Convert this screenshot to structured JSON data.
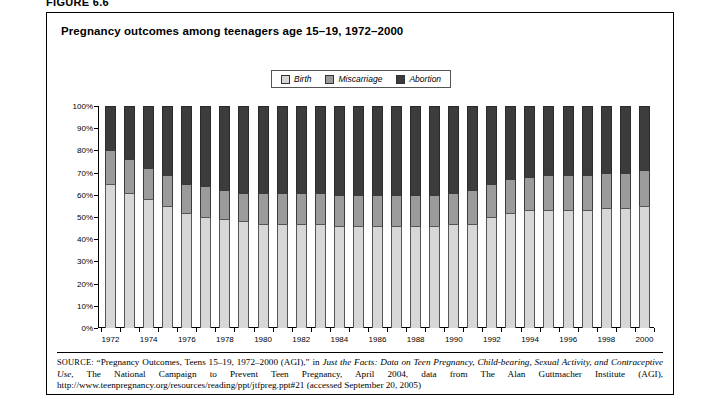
{
  "figure": {
    "label": "FIGURE 6.6"
  },
  "chart": {
    "title": "Pregnancy outcomes among teenagers age 15–19, 1972–2000"
  },
  "legend": {
    "position": "top-center",
    "items": [
      {
        "label": "Birth",
        "color": "#d7d7d7",
        "icon": "legend-swatch-birth"
      },
      {
        "label": "Miscarriage",
        "color": "#9b9b9b",
        "icon": "legend-swatch-miscarriage"
      },
      {
        "label": "Abortion",
        "color": "#3c3c3c",
        "icon": "legend-swatch-abortion"
      }
    ]
  },
  "source": {
    "prefix": "SOURCE:",
    "part1": " “Pregnancy Outcomes, Teens 15–19, 1972–2000 (AGI),” in ",
    "italic1": "Just the Facts: Data on Teen Pregnancy, Child-bearing, Sexual Activity, and Contraceptive Use",
    "part2": ", The National Campaign to Prevent Teen Pregnancy, April 2004, data from The Alan Guttmacher Institute (AGI), http://www.teenpregnancy.org/resources/reading/ppt/jtfpreg.ppt#21 (accessed September 20, 2005)"
  },
  "chart_data": {
    "type": "bar",
    "subtype": "stacked-100-percent",
    "title": "Pregnancy outcomes among teenagers age 15–19, 1972–2000",
    "xlabel": "",
    "ylabel": "",
    "ylim": [
      0,
      100
    ],
    "yticks": [
      "0%",
      "10%",
      "20%",
      "30%",
      "40%",
      "50%",
      "60%",
      "70%",
      "80%",
      "90%",
      "100%"
    ],
    "ytick_values": [
      0,
      10,
      20,
      30,
      40,
      50,
      60,
      70,
      80,
      90,
      100
    ],
    "grid": false,
    "legend_position": "top-center",
    "categories": [
      1972,
      1973,
      1974,
      1975,
      1976,
      1977,
      1978,
      1979,
      1980,
      1981,
      1982,
      1983,
      1984,
      1985,
      1986,
      1987,
      1988,
      1989,
      1990,
      1991,
      1992,
      1993,
      1994,
      1995,
      1996,
      1997,
      1998,
      1999,
      2000
    ],
    "xtick_labels": [
      "1972",
      "",
      "1974",
      "",
      "1976",
      "",
      "1978",
      "",
      "1980",
      "",
      "1982",
      "",
      "1984",
      "",
      "1986",
      "",
      "1988",
      "",
      "1990",
      "",
      "1992",
      "",
      "1994",
      "",
      "1996",
      "",
      "1998",
      "",
      "2000"
    ],
    "series": [
      {
        "name": "Birth",
        "color": "#d7d7d7",
        "values": [
          65,
          61,
          58,
          55,
          52,
          50,
          49,
          48,
          47,
          47,
          47,
          47,
          46,
          46,
          46,
          46,
          46,
          46,
          47,
          47,
          50,
          52,
          53,
          53,
          53,
          53,
          54,
          54,
          55
        ]
      },
      {
        "name": "Miscarriage",
        "color": "#9b9b9b",
        "values": [
          15,
          15,
          14,
          14,
          13,
          14,
          13,
          13,
          14,
          14,
          14,
          14,
          14,
          14,
          14,
          14,
          14,
          14,
          14,
          15,
          15,
          15,
          15,
          16,
          16,
          16,
          16,
          16,
          16
        ]
      },
      {
        "name": "Abortion",
        "color": "#3c3c3c",
        "values": [
          20,
          24,
          28,
          31,
          35,
          36,
          38,
          39,
          39,
          39,
          39,
          39,
          40,
          40,
          40,
          40,
          40,
          40,
          39,
          38,
          35,
          33,
          32,
          31,
          31,
          31,
          30,
          30,
          29
        ]
      }
    ],
    "cumulative_tops": {
      "birth_top": [
        65,
        61,
        58,
        55,
        52,
        50,
        49,
        48,
        47,
        47,
        47,
        47,
        46,
        46,
        46,
        46,
        46,
        46,
        47,
        47,
        50,
        52,
        53,
        53,
        53,
        53,
        54,
        54,
        55
      ],
      "miscarriage_top": [
        80,
        76,
        72,
        69,
        65,
        64,
        62,
        61,
        61,
        61,
        61,
        61,
        60,
        60,
        60,
        60,
        60,
        60,
        61,
        62,
        65,
        67,
        68,
        69,
        69,
        69,
        70,
        70,
        71
      ]
    }
  }
}
